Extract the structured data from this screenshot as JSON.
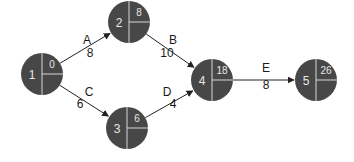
{
  "diagram": {
    "type": "activity-on-arrow network",
    "colors": {
      "node_fill": "#474747",
      "node_divider": "#d8d8d8",
      "edge": "#222222",
      "text": "#1a1a1a",
      "node_text": "#e8e8e8"
    },
    "nodes": [
      {
        "id": "1",
        "label": "1",
        "value": "0"
      },
      {
        "id": "2",
        "label": "2",
        "value": "8"
      },
      {
        "id": "3",
        "label": "3",
        "value": "6"
      },
      {
        "id": "4",
        "label": "4",
        "value": "18"
      },
      {
        "id": "5",
        "label": "5",
        "value": "26"
      }
    ],
    "edges": [
      {
        "from": "1",
        "to": "2",
        "activity": "A",
        "duration": "8"
      },
      {
        "from": "2",
        "to": "4",
        "activity": "B",
        "duration": "10"
      },
      {
        "from": "1",
        "to": "3",
        "activity": "C",
        "duration": "6"
      },
      {
        "from": "3",
        "to": "4",
        "activity": "D",
        "duration": "4"
      },
      {
        "from": "4",
        "to": "5",
        "activity": "E",
        "duration": "8"
      }
    ]
  }
}
